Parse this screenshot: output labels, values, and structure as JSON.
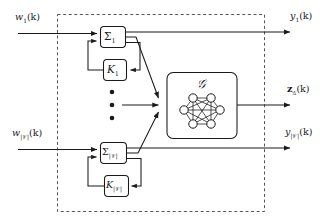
{
  "figure": {
    "type": "block-diagram",
    "background": "#ffffff",
    "line_color": "#1a1a1a",
    "dashed_boundary_color": "#555555"
  },
  "inputs": [
    {
      "id": "w1",
      "base": "w",
      "sub": "1",
      "arg": "(k)",
      "text": "w₁(k)"
    },
    {
      "id": "wV",
      "base": "w",
      "sub": "|𝒱|",
      "arg": "(k)",
      "text": "w|V|(k)"
    }
  ],
  "outputs": [
    {
      "id": "y1",
      "base": "y",
      "sub": "1",
      "arg": "(k)",
      "text": "y₁(k)"
    },
    {
      "id": "zG",
      "base": "z",
      "sub": "𝒢",
      "arg": "(k)",
      "text": "z𝒢(k)"
    },
    {
      "id": "yV",
      "base": "y",
      "sub": "|𝒱|",
      "arg": "(k)",
      "text": "y|V|(k)"
    }
  ],
  "blocks": {
    "sigma_top": {
      "base": "Σ",
      "sub": "1",
      "name": "plant-1"
    },
    "gain_top": {
      "base": "K",
      "sub": "1",
      "name": "controller-1"
    },
    "sigma_bottom": {
      "base": "Σ",
      "sub": "|𝒱|",
      "name": "plant-V"
    },
    "gain_bottom": {
      "base": "K",
      "sub": "|𝒱|",
      "name": "controller-V"
    },
    "graph_block": {
      "base": "𝒢",
      "sub": "",
      "name": "graph-network",
      "nodes": 6,
      "edges": "complete"
    }
  },
  "ellipsis": {
    "dots": 3,
    "orientation": "vertical"
  },
  "connections": [
    {
      "from": "w1",
      "to": "sigma_top",
      "style": "solid-arrow"
    },
    {
      "from": "sigma_top",
      "to": "y1",
      "style": "solid-arrow"
    },
    {
      "from": "sigma_top",
      "to": "gain_top",
      "style": "solid-arrow"
    },
    {
      "from": "gain_top",
      "to": "sigma_top",
      "style": "solid-arrow"
    },
    {
      "from": "sigma_top",
      "to": "graph_block",
      "style": "solid-arrow"
    },
    {
      "from": "wV",
      "to": "sigma_bottom",
      "style": "solid-arrow"
    },
    {
      "from": "sigma_bottom",
      "to": "yV",
      "style": "solid-arrow"
    },
    {
      "from": "sigma_bottom",
      "to": "gain_bottom",
      "style": "solid-arrow"
    },
    {
      "from": "gain_bottom",
      "to": "sigma_bottom",
      "style": "solid-arrow"
    },
    {
      "from": "sigma_bottom",
      "to": "graph_block",
      "style": "solid-arrow"
    },
    {
      "from": "ellipsis",
      "to": "graph_block",
      "style": "solid-arrow"
    },
    {
      "from": "graph_block",
      "to": "zG",
      "style": "solid-arrow"
    }
  ]
}
